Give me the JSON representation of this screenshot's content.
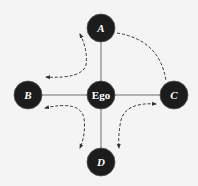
{
  "diagram": {
    "type": "ego-network",
    "background": "#f4f4f4",
    "node_color": "#1c1c1c",
    "node_stroke": "#555555",
    "edge_color": "#6e6e6e",
    "dashed_color": "#333333",
    "nodes": [
      {
        "id": "ego",
        "label": "Ego",
        "cx": 101,
        "cy": 95,
        "r": 14,
        "italic": false
      },
      {
        "id": "A",
        "label": "A",
        "cx": 101,
        "cy": 28,
        "r": 14,
        "italic": true
      },
      {
        "id": "B",
        "label": "B",
        "cx": 28,
        "cy": 95,
        "r": 14,
        "italic": true
      },
      {
        "id": "C",
        "label": "C",
        "cx": 174,
        "cy": 95,
        "r": 14,
        "italic": true
      },
      {
        "id": "D",
        "label": "D",
        "cx": 101,
        "cy": 162,
        "r": 14,
        "italic": true
      }
    ],
    "edges": [
      {
        "from": "ego",
        "to": "A",
        "style": "solid"
      },
      {
        "from": "ego",
        "to": "B",
        "style": "solid"
      },
      {
        "from": "ego",
        "to": "C",
        "style": "solid"
      },
      {
        "from": "ego",
        "to": "D",
        "style": "solid"
      }
    ],
    "dashed_arrows": [
      {
        "id": "A-B",
        "between": [
          "A",
          "B"
        ],
        "heads": "both"
      },
      {
        "id": "A-C",
        "between": [
          "A",
          "C"
        ],
        "heads": "none"
      },
      {
        "id": "B-D",
        "between": [
          "B",
          "D"
        ],
        "heads": "both"
      },
      {
        "id": "C-D",
        "between": [
          "C",
          "D"
        ],
        "heads": "both"
      }
    ]
  }
}
